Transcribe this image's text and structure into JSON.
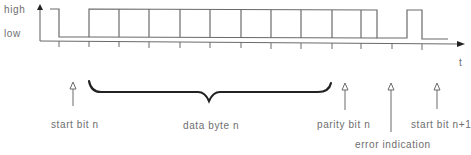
{
  "axis": {
    "y_high_label": "high",
    "y_low_label": "low",
    "x_label": "t"
  },
  "waveform": {
    "levels": {
      "high_y": 9,
      "low_y": 37
    },
    "bit_boundaries_x": [
      89,
      119,
      149,
      180,
      210,
      241,
      271,
      301,
      332,
      361
    ],
    "segments": [
      {
        "name": "idle",
        "level": "high",
        "x0": 50,
        "x1": 59
      },
      {
        "name": "start-bit",
        "level": "low",
        "x0": 59,
        "x1": 89
      },
      {
        "name": "data-and-parity",
        "level": "high",
        "x0": 89,
        "x1": 377
      },
      {
        "name": "error-gap",
        "level": "low",
        "x0": 377,
        "x1": 407
      },
      {
        "name": "error-pulse",
        "level": "high",
        "x0": 407,
        "x1": 422
      },
      {
        "name": "next-start",
        "level": "low",
        "x0": 422,
        "x1": 448
      }
    ]
  },
  "annotations": [
    {
      "id": "start-bit-n",
      "label": "start bit n",
      "arrow_x": 73
    },
    {
      "id": "data-byte-n",
      "label": "data byte n",
      "brace_x0": 89,
      "brace_x1": 331
    },
    {
      "id": "parity-bit-n",
      "label": "parity bit n",
      "arrow_x": 345
    },
    {
      "id": "error-indication",
      "label": "error indication",
      "arrow_x": 391
    },
    {
      "id": "start-bit-n1",
      "label": "start bit n+1",
      "arrow_x": 437
    }
  ],
  "colors": {
    "line": "#6a6a6a",
    "brace": "#222222",
    "text": "#6e6e6e"
  }
}
